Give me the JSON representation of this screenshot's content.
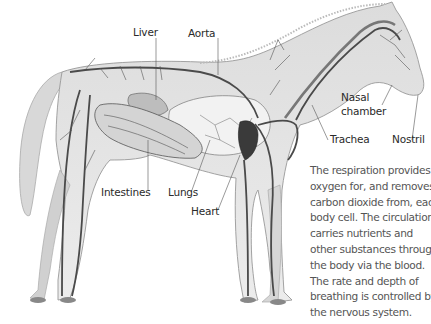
{
  "diagram": {
    "labels": {
      "liver": "Liver",
      "aorta": "Aorta",
      "nasal_chamber_line1": "Nasal",
      "nasal_chamber_line2": "chamber",
      "trachea": "Trachea",
      "nostril": "Nostril",
      "intestines": "Intestines",
      "lungs": "Lungs",
      "heart": "Heart"
    },
    "caption_lines": [
      "The respiration provides",
      "oxygen for, and removes",
      "carbon dioxide from, each",
      "body cell. The circulation",
      "carries nutrients and",
      "other substances through",
      "the body via the blood.",
      "The rate and depth of",
      "breathing is controlled by",
      "the nervous system."
    ],
    "colors": {
      "body": "#e4e4e4",
      "outline": "#9a9a9a",
      "vessel": "#4a4a4a",
      "heart": "#3a3a3a",
      "text": "#2a2a2a",
      "caption": "#555555"
    }
  }
}
